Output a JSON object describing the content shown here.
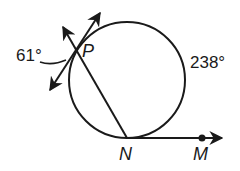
{
  "diagram": {
    "type": "circle-geometry",
    "circle": {
      "cx": 127,
      "cy": 80,
      "r": 58
    },
    "points": {
      "P": {
        "label": "P",
        "x": 74,
        "y": 53
      },
      "N": {
        "label": "N",
        "x": 127,
        "y": 138
      },
      "M": {
        "label": "M",
        "x": 202,
        "y": 138
      }
    },
    "labels": {
      "angle_outside": "61°",
      "arc_major": "238°",
      "point_P": "P",
      "point_N": "N",
      "point_M": "M"
    },
    "segments": [
      {
        "name": "secant-PN",
        "from": "P",
        "to": "N",
        "extends_beyond": "P",
        "arrow": true
      },
      {
        "name": "tangent-line-at-P",
        "through": "P",
        "arrows": "both"
      },
      {
        "name": "ray-NM",
        "from": "N",
        "through": "M",
        "arrow": true
      }
    ],
    "colors": {
      "stroke": "#1a1a1a",
      "background": "#ffffff"
    }
  }
}
